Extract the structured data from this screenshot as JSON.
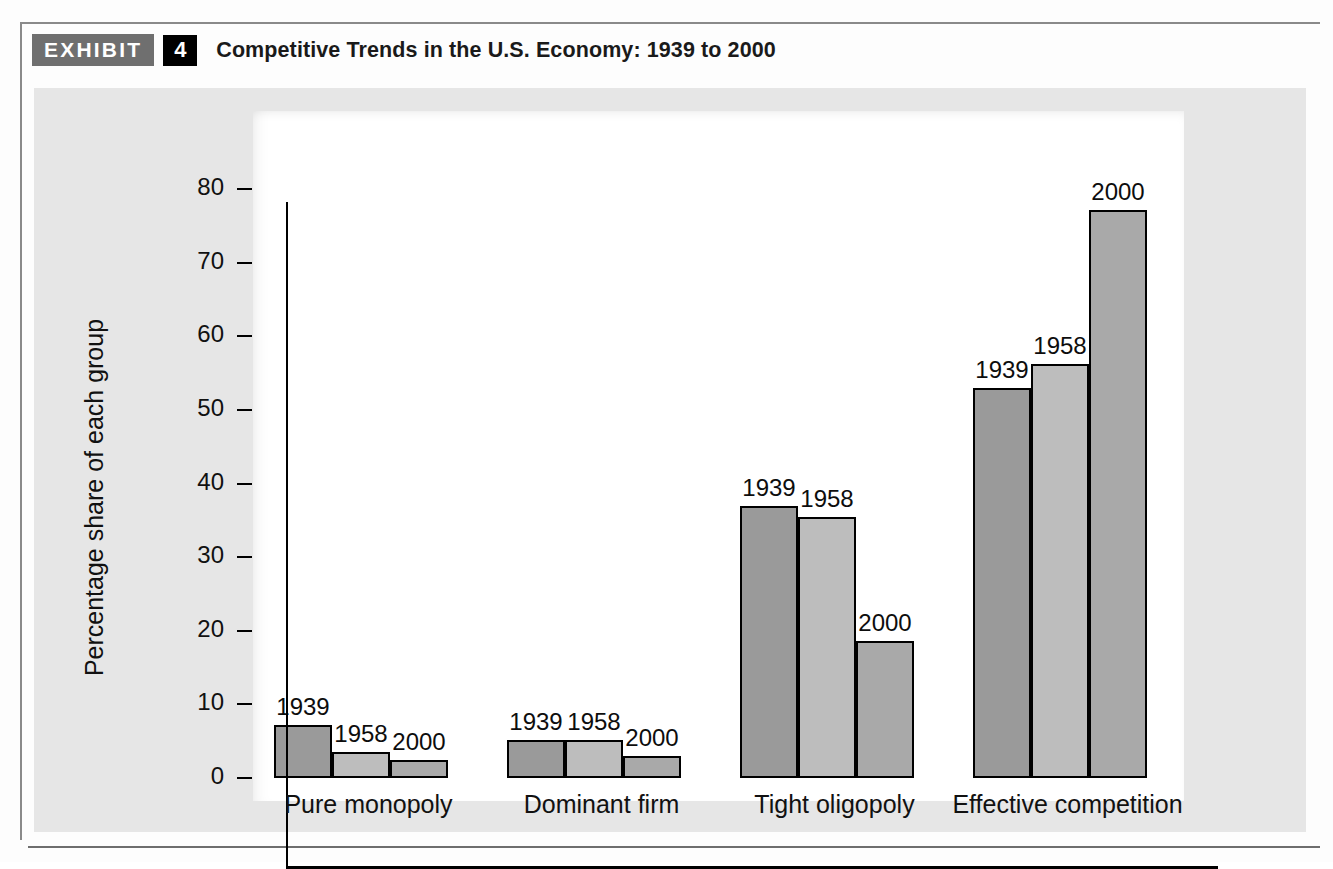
{
  "exhibit": {
    "badge_label": "EXHIBIT",
    "number": "4",
    "title": "Competitive Trends in the U.S. Economy: 1939 to 2000"
  },
  "colors": {
    "badge_gray": "#6f6f6f",
    "badge_black": "#000000",
    "panel_gray": "#e6e6e6",
    "plot_white": "#ffffff",
    "bar_1939": "#9a9a9a",
    "bar_1958": "#bdbdbd",
    "bar_2000": "#a9a9a9",
    "axis_black": "#000000"
  },
  "chart_data": {
    "type": "bar",
    "title": "Competitive Trends in the U.S. Economy: 1939 to 2000",
    "xlabel": "",
    "ylabel": "Percentage share of each group",
    "ylim": [
      0,
      85
    ],
    "yticks": [
      0,
      10,
      20,
      30,
      40,
      50,
      60,
      70,
      80
    ],
    "ytick_labels": [
      "0",
      "10",
      "20",
      "30",
      "40",
      "50",
      "60",
      "70",
      "80"
    ],
    "grid": false,
    "legend": "none (bars labeled directly)",
    "categories": [
      "Pure monopoly",
      "Dominant firm",
      "Tight oligopoly",
      "Effective competition"
    ],
    "series": [
      {
        "name": "1939",
        "color": "#9a9a9a",
        "values": [
          7.2,
          5.2,
          37.0,
          53.0
        ]
      },
      {
        "name": "1958",
        "color": "#bdbdbd",
        "values": [
          3.6,
          5.2,
          35.5,
          56.3
        ]
      },
      {
        "name": "2000",
        "color": "#a9a9a9",
        "values": [
          2.4,
          3.0,
          18.6,
          77.2
        ]
      }
    ],
    "bar_labels": [
      [
        "1939",
        "1958",
        "2000"
      ],
      [
        "1939",
        "1958",
        "2000"
      ],
      [
        "1939",
        "1958",
        "2000"
      ],
      [
        "1939",
        "1958",
        "2000"
      ]
    ]
  }
}
